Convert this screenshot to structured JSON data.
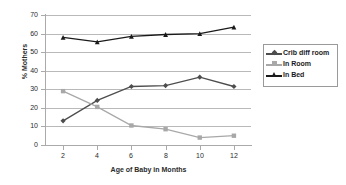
{
  "chart_data": {
    "type": "line",
    "title": "",
    "subtitle": "",
    "xlabel": "Age of Baby in Months",
    "ylabel": "% Mothers",
    "x": [
      2,
      4,
      6,
      8,
      10,
      12
    ],
    "categories": [
      "2",
      "4",
      "6",
      "8",
      "10",
      "12"
    ],
    "xlim": [
      1,
      13
    ],
    "ylim": [
      0,
      70
    ],
    "yticks": [
      0,
      10,
      20,
      30,
      40,
      50,
      60,
      70
    ],
    "ytick_labels": [
      "0",
      "10",
      "20",
      "30",
      "40",
      "50",
      "60",
      "70"
    ],
    "grid": "horizontal",
    "legend_position": "right",
    "series": [
      {
        "name": "Crib diff room",
        "color": "#4d4d4d",
        "marker": "diamond",
        "values": [
          13,
          24,
          31.5,
          32,
          36.5,
          31.5
        ]
      },
      {
        "name": "In Room",
        "color": "#a8a8a8",
        "marker": "square",
        "values": [
          29,
          20.5,
          10.5,
          8.5,
          4,
          5
        ]
      },
      {
        "name": "In Bed",
        "color": "#1a1a1a",
        "marker": "triangle",
        "values": [
          58,
          55.5,
          58.5,
          59.5,
          60,
          63.5
        ]
      }
    ]
  },
  "legend": {
    "items": [
      {
        "label": "Crib diff room"
      },
      {
        "label": "In Room"
      },
      {
        "label": "In Bed"
      }
    ]
  },
  "axes": {
    "y_title": "% Mothers",
    "x_title": "Age of Baby in Months"
  },
  "colors": {
    "gridline": "#b9b9b9",
    "axis": "#aaaaaa",
    "background": "#ffffff",
    "text": "#2b2b2b"
  }
}
